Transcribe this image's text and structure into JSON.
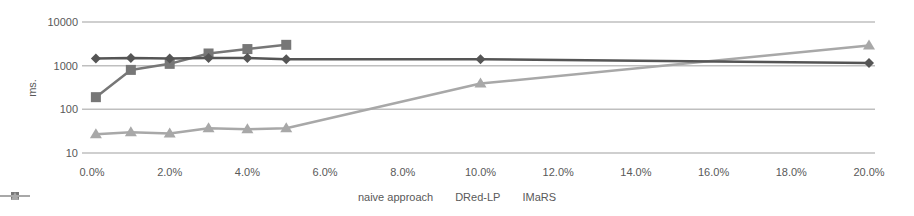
{
  "chart_data": {
    "type": "line",
    "title": "",
    "xlabel": "",
    "ylabel": "ms.",
    "yscale": "log",
    "ylim": [
      10,
      10000
    ],
    "xlim": [
      0,
      20
    ],
    "y_ticks": [
      "10",
      "100",
      "1000",
      "10000"
    ],
    "x_ticks": [
      "0.0%",
      "2.0%",
      "4.0%",
      "6.0%",
      "8.0%",
      "10.0%",
      "12.0%",
      "14.0%",
      "16.0%",
      "18.0%",
      "20.0%"
    ],
    "grid": "horizontal",
    "legend_position": "bottom",
    "series": [
      {
        "name": "naive approach",
        "marker": "diamond",
        "color": "#555555",
        "x": [
          0.1,
          1,
          2,
          3,
          4,
          5,
          10,
          20
        ],
        "values": [
          1450,
          1500,
          1450,
          1500,
          1500,
          1400,
          1400,
          1150
        ]
      },
      {
        "name": "DRed-LP",
        "marker": "square",
        "color": "#777777",
        "x": [
          0.1,
          1,
          2,
          3,
          4,
          5
        ],
        "values": [
          190,
          800,
          1100,
          1900,
          2400,
          3000
        ]
      },
      {
        "name": "IMaRS",
        "marker": "triangle",
        "color": "#a8a8a8",
        "x": [
          0.1,
          1,
          2,
          3,
          4,
          5,
          10,
          20
        ],
        "values": [
          27,
          30,
          28,
          37,
          35,
          37,
          390,
          2900
        ]
      }
    ]
  },
  "legend": {
    "items": [
      {
        "label": "naive approach"
      },
      {
        "label": "DRed-LP"
      },
      {
        "label": "IMaRS"
      }
    ]
  }
}
